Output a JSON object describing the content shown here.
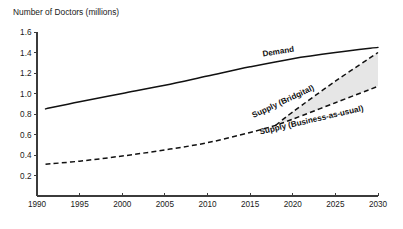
{
  "chart_data": {
    "type": "line",
    "title": "Number of Doctors (millions)",
    "xlabel": "",
    "ylabel": "Number of Doctors (millions)",
    "xlim": [
      1990,
      2030
    ],
    "ylim": [
      0,
      1.6
    ],
    "grid": false,
    "legend_position": "inline-labels",
    "x_ticks": [
      "1990",
      "1995",
      "2000",
      "2005",
      "2010",
      "2015",
      "2020",
      "2025",
      "2030"
    ],
    "y_ticks": [
      "0.2",
      "0.4",
      "0.6",
      "0.8",
      "1.0",
      "1.2",
      "1.4",
      "1.6"
    ],
    "series": [
      {
        "name": "Demand",
        "style": "solid",
        "label": "Demand",
        "label_x": 2016.5,
        "label_y": 1.36,
        "label_rotation": -9,
        "x": [
          1991,
          1995,
          2000,
          2005,
          2010,
          2015,
          2020,
          2025,
          2030
        ],
        "values": [
          0.85,
          0.92,
          1.0,
          1.08,
          1.17,
          1.26,
          1.34,
          1.4,
          1.45
        ]
      },
      {
        "name": "Supply (Business-as-usual)",
        "style": "dashed",
        "label": "Supply (Business-as-usual)",
        "label_x": 2016.2,
        "label_y": 0.6,
        "label_rotation": -13,
        "x": [
          1991,
          1995,
          2000,
          2005,
          2010,
          2015,
          2018,
          2020,
          2025,
          2030
        ],
        "values": [
          0.31,
          0.34,
          0.39,
          0.45,
          0.52,
          0.62,
          0.69,
          0.75,
          0.91,
          1.07
        ]
      },
      {
        "name": "Supply (Bridgital)",
        "style": "dashed",
        "label": "Supply (Bridgital)",
        "label_x": 2015.4,
        "label_y": 0.76,
        "label_rotation": -25,
        "x": [
          2018,
          2020,
          2025,
          2030
        ],
        "values": [
          0.69,
          0.82,
          1.12,
          1.4
        ]
      }
    ],
    "shaded_region": {
      "name": "gap-between-supply-scenarios",
      "between": [
        "Supply (Bridgital)",
        "Supply (Business-as-usual)"
      ],
      "start_x": 2018,
      "end_x": 2030,
      "color": "#e6e6e6"
    }
  }
}
